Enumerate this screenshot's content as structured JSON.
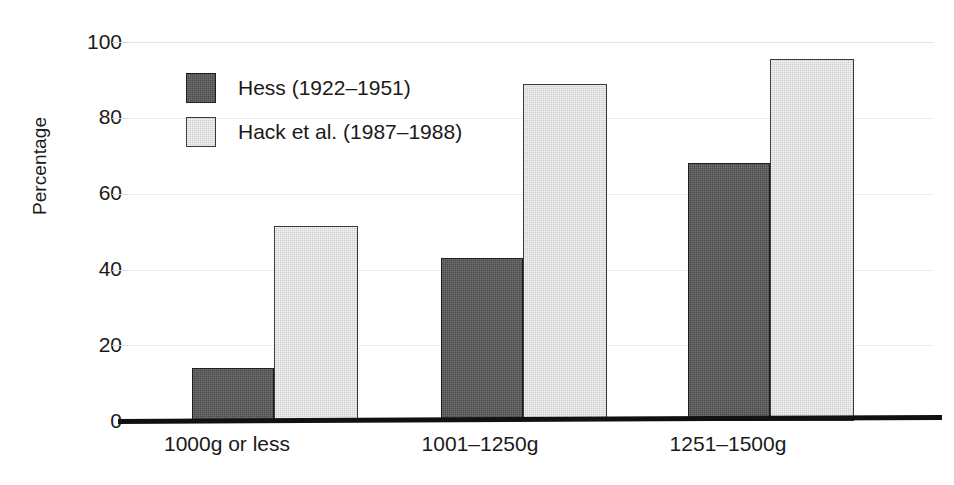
{
  "chart_data": {
    "type": "bar",
    "title": "",
    "xlabel": "",
    "ylabel": "Percentage",
    "categories": [
      "1000g or less",
      "1001–1250g",
      "1251–1500g"
    ],
    "series": [
      {
        "name": "Hess (1922–1951)",
        "values": [
          14,
          43,
          68
        ],
        "color": "#4c4c4c"
      },
      {
        "name": "Hack et al. (1987–1988)",
        "values": [
          51.5,
          89,
          95.5
        ],
        "color": "#cfcfcf"
      }
    ],
    "ylim": [
      0,
      100
    ],
    "yticks": [
      0,
      20,
      40,
      60,
      80,
      100
    ],
    "ytick_labels": [
      "0",
      "20",
      "40",
      "60",
      "80",
      "100"
    ],
    "grid": true,
    "grid_axis": "y",
    "legend_position": "upper-left-inside"
  },
  "axes": {
    "y_label": "Percentage",
    "y_ticks": [
      "100",
      "80",
      "60",
      "40",
      "20",
      "0"
    ]
  },
  "legend": {
    "entries": [
      {
        "label": "Hess (1922–1951)",
        "swatch": "dark"
      },
      {
        "label": "Hack et al. (1987–1988)",
        "swatch": "light"
      }
    ]
  },
  "colors": {
    "series_dark": "#4c4c4c",
    "series_light": "#cfcfcf",
    "axis": "#111111",
    "grid": "#ededed",
    "text": "#1a1a1a",
    "background": "#ffffff"
  }
}
